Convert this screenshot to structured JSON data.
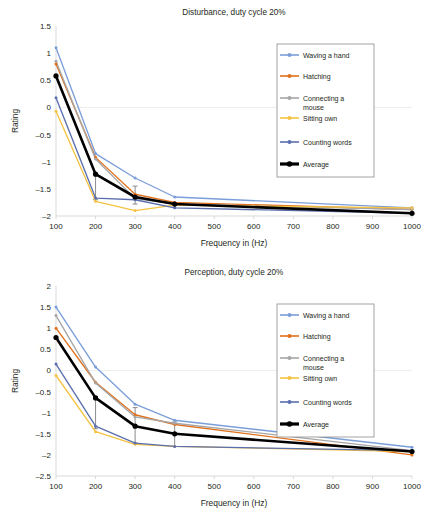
{
  "figure": {
    "axis_label_x": "Frequency in (Hz)",
    "axis_label_y": "Rating"
  },
  "legend": {
    "items": [
      {
        "label": "Waving a hand",
        "color": "#7b9ed9"
      },
      {
        "label": "Hatching",
        "color": "#e2711d"
      },
      {
        "label": "Connecting a mouse",
        "color": "#a6a6a6"
      },
      {
        "label": "Sitting own",
        "color": "#f5c242"
      },
      {
        "label": "Counting words",
        "color": "#5b6fae"
      },
      {
        "label": "Average",
        "color": "#000000"
      }
    ]
  },
  "chart_data": [
    {
      "type": "line",
      "title": "Disturbance, duty cycle 20%",
      "xlabel": "Frequency in (Hz)",
      "ylabel": "Rating",
      "x": [
        100,
        200,
        300,
        400,
        1000
      ],
      "xticks": [
        100,
        200,
        300,
        400,
        500,
        600,
        700,
        800,
        900,
        1000
      ],
      "xlim": [
        100,
        1000
      ],
      "ylim": [
        -2,
        1.5
      ],
      "yticks": [
        1.5,
        1,
        0.5,
        0,
        -0.5,
        -1,
        -1.5,
        -2
      ],
      "ytick_labels": [
        "1.5",
        "1",
        "0.5",
        "0",
        "–0.5",
        "–1",
        "–1.5",
        "–2"
      ],
      "grid": false,
      "legend_position": "right",
      "series": [
        {
          "name": "Waving a hand",
          "color": "#7b9ed9",
          "values": [
            1.1,
            -0.85,
            -1.3,
            -1.65,
            -1.85
          ]
        },
        {
          "name": "Hatching",
          "color": "#e2711d",
          "values": [
            0.8,
            -0.92,
            -1.6,
            -1.75,
            -1.88
          ]
        },
        {
          "name": "Connecting a mouse",
          "color": "#a6a6a6",
          "values": [
            0.85,
            -0.95,
            -1.68,
            -1.78,
            -1.88
          ]
        },
        {
          "name": "Sitting own",
          "color": "#f5c242",
          "values": [
            -0.07,
            -1.73,
            -1.9,
            -1.8,
            -1.85
          ]
        },
        {
          "name": "Counting words",
          "color": "#5b6fae",
          "values": [
            0.18,
            -1.67,
            -1.7,
            -1.85,
            -1.95
          ]
        },
        {
          "name": "Average",
          "color": "#000000",
          "values": [
            0.58,
            -1.23,
            -1.65,
            -1.78,
            -1.95
          ]
        }
      ],
      "error_bars": [
        {
          "series": "Average",
          "x": 300,
          "y": -1.65,
          "low": -1.78,
          "high": -1.45
        },
        {
          "series": "Average",
          "x": 200,
          "y": -1.23,
          "low": -1.7,
          "high": -1.23
        }
      ]
    },
    {
      "type": "line",
      "title": "Perception, duty cycle 20%",
      "xlabel": "Frequency in (Hz)",
      "ylabel": "Rating",
      "x": [
        100,
        200,
        300,
        400,
        1000
      ],
      "xticks": [
        100,
        200,
        300,
        400,
        500,
        600,
        700,
        800,
        900,
        1000
      ],
      "xlim": [
        100,
        1000
      ],
      "ylim": [
        -2.5,
        2
      ],
      "yticks": [
        2,
        1.5,
        1,
        0.5,
        0,
        -0.5,
        -1,
        -1.5,
        -2,
        -2.5
      ],
      "ytick_labels": [
        "2",
        "1.5",
        "1",
        "0.5",
        "0",
        "–0.5",
        "–1",
        "–1.5",
        "–2",
        "–2.5"
      ],
      "grid": false,
      "legend_position": "right",
      "series": [
        {
          "name": "Waving a hand",
          "color": "#7b9ed9",
          "values": [
            1.5,
            0.08,
            -0.8,
            -1.18,
            -1.82
          ]
        },
        {
          "name": "Hatching",
          "color": "#e2711d",
          "values": [
            1.0,
            -0.28,
            -1.05,
            -1.28,
            -2.0
          ]
        },
        {
          "name": "Connecting a mouse",
          "color": "#a6a6a6",
          "values": [
            1.3,
            -0.3,
            -1.1,
            -1.25,
            -1.9
          ]
        },
        {
          "name": "Sitting own",
          "color": "#f5c242",
          "values": [
            -0.12,
            -1.45,
            -1.75,
            -1.8,
            -1.92
          ]
        },
        {
          "name": "Counting words",
          "color": "#5b6fae",
          "values": [
            0.15,
            -1.32,
            -1.72,
            -1.8,
            -1.9
          ]
        },
        {
          "name": "Average",
          "color": "#000000",
          "values": [
            0.78,
            -0.65,
            -1.32,
            -1.5,
            -1.92
          ]
        }
      ],
      "error_bars": [
        {
          "series": "Average",
          "x": 200,
          "y": -0.65,
          "low": -1.38,
          "high": -0.62
        },
        {
          "series": "Average",
          "x": 300,
          "y": -1.32,
          "low": -1.72,
          "high": -0.88
        },
        {
          "series": "Average",
          "x": 400,
          "y": -1.5,
          "low": -1.8,
          "high": -1.22
        }
      ]
    }
  ]
}
